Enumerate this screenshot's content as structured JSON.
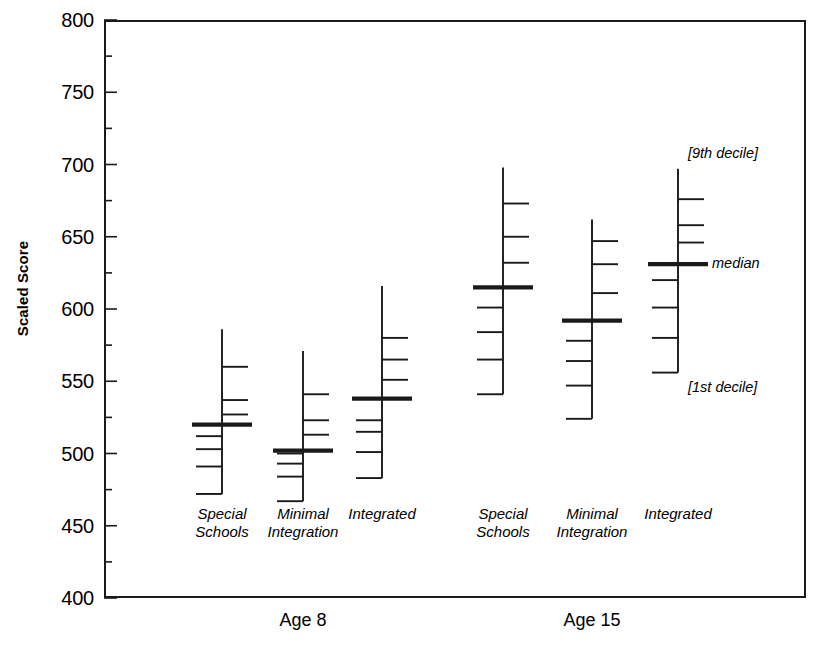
{
  "chart": {
    "type": "box",
    "ylabel": "Scaled Score",
    "ylim": [
      400,
      800
    ],
    "ytick_step": 50,
    "yticks": [
      800,
      750,
      700,
      650,
      600,
      550,
      500,
      450,
      400
    ],
    "minor_ticks": true,
    "grid": false,
    "legend": "none",
    "axis_color": "#1a1a1a"
  },
  "chart_data": {
    "type": "box",
    "title": "",
    "xlabel": "",
    "ylabel": "Scaled Score",
    "ylim": [
      400,
      800
    ],
    "yticks": [
      400,
      450,
      500,
      550,
      600,
      650,
      700,
      750,
      800
    ],
    "grid": false,
    "legend_position": "none",
    "marker_semantics": {
      "top_whisker": "9th decile",
      "bold_center_bar": "median",
      "bottom_whisker": "1st decile",
      "intermediate_bars": "2nd through 8th deciles"
    },
    "supergroups": [
      {
        "label": "Age 8",
        "groups": [
          0,
          1,
          2
        ]
      },
      {
        "label": "Age 15",
        "groups": [
          3,
          4,
          5
        ]
      }
    ],
    "categories": [
      "Special\nSchools",
      "Minimal\nIntegration",
      "Integrated",
      "Special\nSchools",
      "Minimal\nIntegration",
      "Integrated"
    ],
    "series": [
      {
        "name": "Age 8 - Special Schools",
        "age": "Age 8",
        "setting": "Special Schools",
        "deciles": {
          "d1": 472,
          "d2": 491,
          "d3": 503,
          "d4": 512,
          "median": 520,
          "d6": 527,
          "d7": 537,
          "d8": 560,
          "d9": 586
        }
      },
      {
        "name": "Age 8 - Minimal Integration",
        "age": "Age 8",
        "setting": "Minimal Integration",
        "deciles": {
          "d1": 467,
          "d2": 484,
          "d3": 493,
          "d4": 500,
          "median": 502,
          "d6": 513,
          "d7": 523,
          "d8": 541,
          "d9": 571
        }
      },
      {
        "name": "Age 8 - Integrated",
        "age": "Age 8",
        "setting": "Integrated",
        "deciles": {
          "d1": 483,
          "d2": 501,
          "d3": 515,
          "d4": 523,
          "median": 538,
          "d6": 551,
          "d7": 565,
          "d8": 580,
          "d9": 616
        }
      },
      {
        "name": "Age 15 - Special Schools",
        "age": "Age 15",
        "setting": "Special Schools",
        "deciles": {
          "d1": 541,
          "d2": 565,
          "d3": 584,
          "d4": 601,
          "median": 615,
          "d6": 632,
          "d7": 650,
          "d8": 673,
          "d9": 698
        }
      },
      {
        "name": "Age 15 - Minimal Integration",
        "age": "Age 15",
        "setting": "Minimal Integration",
        "deciles": {
          "d1": 524,
          "d2": 547,
          "d3": 564,
          "d4": 578,
          "median": 592,
          "d6": 611,
          "d7": 631,
          "d8": 647,
          "d9": 662
        }
      },
      {
        "name": "Age 15 - Integrated",
        "age": "Age 15",
        "setting": "Integrated",
        "deciles": {
          "d1": 556,
          "d2": 580,
          "d3": 601,
          "d4": 620,
          "median": 631,
          "d6": 646,
          "d7": 658,
          "d8": 676,
          "d9": 697
        }
      }
    ],
    "annotations": [
      {
        "text": "[9th decile]",
        "target_series": 5,
        "target_value": 698
      },
      {
        "text": "median",
        "target_series": 5,
        "target_value": 631
      },
      {
        "text": "[1st decile]",
        "target_series": 5,
        "target_value": 556
      }
    ]
  },
  "labels": {
    "ylabel": "Scaled Score",
    "yticks": [
      "800",
      "750",
      "700",
      "650",
      "600",
      "550",
      "500",
      "450",
      "400"
    ],
    "groups": [
      "Special\nSchools",
      "Minimal\nIntegration",
      "Integrated",
      "Special\nSchools",
      "Minimal\nIntegration",
      "Integrated"
    ],
    "ages": [
      "Age 8",
      "Age 15"
    ],
    "annot_top": "[9th decile]",
    "annot_median": "median",
    "annot_bottom": "[1st decile]"
  }
}
